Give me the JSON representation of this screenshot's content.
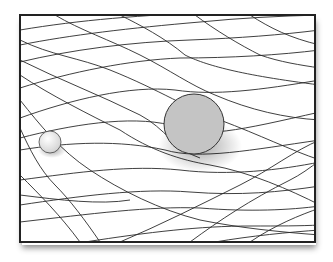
{
  "diagram": {
    "title": "",
    "frame": {
      "x": 20,
      "y": 15,
      "width": 295,
      "height": 227,
      "stroke": "#222222"
    },
    "large_sphere": {
      "cx": 194,
      "cy": 124,
      "r": 30,
      "fill": "#c4c4c4",
      "stroke": "#333333"
    },
    "small_sphere": {
      "cx": 50,
      "cy": 142,
      "r": 11,
      "fill": "#e6e6e6",
      "stroke": "#444444"
    },
    "grid_color": "#2a2a2a"
  }
}
